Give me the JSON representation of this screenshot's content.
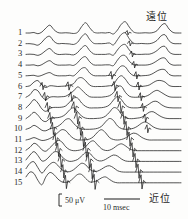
{
  "figure": {
    "background_color": "#fdfdfc",
    "trace_color": "#1a1a1a"
  },
  "channels": {
    "labels": [
      "1",
      "2",
      "3",
      "4",
      "5",
      "6",
      "7",
      "8",
      "9",
      "10",
      "11",
      "12",
      "13",
      "14",
      "15"
    ],
    "count": 15
  },
  "annotations": {
    "distal": "遠位",
    "proximal": "近位"
  },
  "scale_bars": {
    "amplitude_label": "50 μV",
    "time_label": "10 msec"
  },
  "chart_data": {
    "type": "line",
    "xlabel": "",
    "ylabel": "",
    "x_scale_bar": {
      "label": "10 msec",
      "pixels": 36
    },
    "y_scale_bar": {
      "label": "50 μV",
      "pixels": 12
    },
    "grid": false,
    "legend": null,
    "annotations": [
      {
        "text": "遠位",
        "position": "top-right",
        "meaning": "distal"
      },
      {
        "text": "近位",
        "position": "bottom-right",
        "meaning": "proximal"
      }
    ],
    "channel_labels": [
      "1",
      "2",
      "3",
      "4",
      "5",
      "6",
      "7",
      "8",
      "9",
      "10",
      "11",
      "12",
      "13",
      "14",
      "15"
    ],
    "x_domain": [
      0,
      100
    ],
    "series": [
      {
        "name": "1",
        "baseline_y": 33,
        "values": [
          0,
          0,
          0.2,
          -0.3,
          0.4,
          2.0,
          3.2,
          1.4,
          0.2,
          0,
          0.1,
          0,
          -0.2,
          0.3,
          2.6,
          4.2,
          2.2,
          0.4,
          0,
          0.1,
          0,
          0.2,
          -0.4,
          1.2,
          3.6,
          4.6,
          2.4,
          0.5,
          0,
          0,
          0.1,
          0,
          0.2,
          1.0,
          3.0,
          3.8,
          1.6,
          0.2,
          0,
          0
        ]
      },
      {
        "name": "2",
        "baseline_y": 43.7,
        "values": [
          0,
          0,
          -0.2,
          -0.6,
          0.6,
          2.4,
          3.0,
          1.0,
          0,
          0.1,
          0,
          -0.1,
          -0.3,
          0.6,
          2.8,
          4.0,
          1.8,
          0.2,
          0,
          0,
          0.1,
          0.3,
          -0.5,
          1.6,
          3.8,
          4.4,
          2.0,
          0.3,
          0,
          0.1,
          0,
          0,
          0.4,
          1.4,
          3.2,
          3.6,
          1.2,
          0.1,
          0,
          0
        ]
      },
      {
        "name": "3",
        "baseline_y": 54.4,
        "values": [
          0,
          0.1,
          0,
          -0.4,
          0.3,
          1.6,
          2.4,
          0.8,
          0,
          0,
          0.1,
          0,
          -0.2,
          0.8,
          2.6,
          3.6,
          1.6,
          0.2,
          0,
          0,
          0,
          0.2,
          -0.3,
          1.8,
          3.6,
          4.0,
          1.8,
          0.2,
          0,
          0,
          0.1,
          0.1,
          0.6,
          1.6,
          3.0,
          3.2,
          1.0,
          0.1,
          0,
          0
        ]
      },
      {
        "name": "4",
        "baseline_y": 65.1,
        "values": [
          0,
          0,
          0.1,
          -0.3,
          0.2,
          1.2,
          1.8,
          0.6,
          0,
          0,
          0,
          0.1,
          -0.1,
          1.0,
          2.8,
          3.4,
          1.4,
          0.1,
          0,
          0,
          0.1,
          0.1,
          -0.2,
          2.0,
          3.8,
          3.8,
          1.6,
          0.2,
          0,
          0,
          0,
          0.2,
          0.8,
          1.8,
          2.8,
          2.8,
          0.8,
          0,
          0,
          0
        ]
      },
      {
        "name": "5",
        "baseline_y": 75.8,
        "values": [
          0,
          0.1,
          0.2,
          -0.2,
          0.2,
          0.9,
          1.3,
          0.4,
          0,
          0,
          0,
          0.2,
          0,
          1.4,
          3.0,
          3.2,
          1.2,
          0.1,
          0,
          0,
          0,
          0.2,
          0,
          2.4,
          4.0,
          3.6,
          1.4,
          0.1,
          0,
          0,
          0.1,
          0.3,
          1.0,
          2.0,
          2.6,
          2.4,
          0.6,
          0,
          0,
          0
        ]
      },
      {
        "name": "6",
        "baseline_y": 86.5,
        "values": [
          0,
          0.3,
          1.8,
          2.4,
          0.6,
          -0.4,
          0.3,
          0.2,
          0,
          0.1,
          0.2,
          0.6,
          1.2,
          3.2,
          3.6,
          2.4,
          0.6,
          0,
          0,
          0,
          0.1,
          0.3,
          0.8,
          3.2,
          4.4,
          3.0,
          0.8,
          0,
          0,
          0,
          0.2,
          0.6,
          1.6,
          2.4,
          2.4,
          1.8,
          0.4,
          0,
          0,
          0
        ]
      },
      {
        "name": "7",
        "baseline_y": 97.2,
        "values": [
          0,
          1.0,
          3.0,
          2.6,
          0.2,
          -1.0,
          0,
          0.2,
          0.1,
          0.2,
          0.4,
          1.4,
          2.6,
          4.2,
          3.0,
          1.4,
          0.2,
          0,
          0,
          0,
          0.2,
          0.6,
          1.8,
          4.2,
          4.4,
          2.0,
          0.4,
          0,
          0,
          0.1,
          0.3,
          1.0,
          2.2,
          2.8,
          2.0,
          1.0,
          0.2,
          0,
          0,
          0
        ]
      },
      {
        "name": "8",
        "baseline_y": 107.9,
        "values": [
          0,
          1.6,
          3.4,
          2.0,
          -0.4,
          -1.4,
          -0.2,
          0.2,
          0.2,
          0.3,
          0.8,
          2.4,
          4.0,
          4.0,
          2.0,
          0.6,
          0,
          0,
          0,
          0.1,
          0.4,
          1.2,
          3.2,
          4.6,
          3.4,
          1.2,
          0.2,
          0,
          0,
          0.2,
          0.6,
          1.6,
          2.6,
          2.6,
          1.4,
          0.5,
          0.1,
          0,
          0,
          0
        ]
      },
      {
        "name": "9",
        "baseline_y": 118.6,
        "values": [
          0,
          1.2,
          2.6,
          1.4,
          -0.6,
          -1.2,
          0,
          0.3,
          0.4,
          0.8,
          1.8,
          3.6,
          4.4,
          2.8,
          1.0,
          0.2,
          0,
          0,
          0.1,
          0.3,
          1.0,
          2.6,
          4.4,
          4.0,
          1.8,
          0.4,
          0,
          0,
          0.2,
          0.5,
          1.4,
          2.6,
          2.8,
          1.8,
          0.8,
          0.2,
          0,
          0,
          0,
          0
        ]
      },
      {
        "name": "10",
        "baseline_y": 129.3,
        "values": [
          0,
          0.6,
          1.6,
          0.8,
          -0.4,
          -0.6,
          0.2,
          0.6,
          1.2,
          2.4,
          4.0,
          4.2,
          2.4,
          0.8,
          0.1,
          0,
          0,
          0.1,
          0.4,
          1.2,
          3.0,
          4.4,
          3.6,
          1.4,
          0.3,
          0,
          0.1,
          0.4,
          1.2,
          2.4,
          3.0,
          2.2,
          1.0,
          0.3,
          0,
          0,
          0,
          0,
          0,
          0
        ]
      },
      {
        "name": "11",
        "baseline_y": 140,
        "values": [
          0,
          0.4,
          1.0,
          0.4,
          -0.2,
          0,
          0.6,
          1.6,
          3.0,
          4.2,
          3.8,
          2.0,
          0.6,
          0,
          0,
          0.1,
          0.4,
          1.4,
          3.2,
          4.2,
          3.0,
          1.0,
          0.2,
          0,
          0.2,
          0.8,
          2.0,
          2.8,
          2.4,
          1.2,
          0.4,
          0,
          0,
          0,
          0,
          0,
          0,
          0,
          0,
          0
        ]
      },
      {
        "name": "12",
        "baseline_y": 150.7,
        "values": [
          0.2,
          1.4,
          3.0,
          2.2,
          0.4,
          -0.2,
          1.2,
          2.8,
          4.2,
          3.6,
          1.6,
          0.4,
          0,
          0.1,
          0.5,
          1.6,
          3.4,
          4.0,
          2.4,
          0.8,
          0.1,
          0.2,
          1.0,
          2.2,
          2.8,
          2.0,
          0.8,
          0.2,
          0,
          0,
          0,
          0,
          0,
          0,
          0,
          0,
          0,
          0,
          0,
          0
        ]
      },
      {
        "name": "13",
        "baseline_y": 161.4,
        "values": [
          0.6,
          2.6,
          4.0,
          2.4,
          0.2,
          0.6,
          2.2,
          3.8,
          3.8,
          2.0,
          0.6,
          0,
          0.2,
          0.8,
          2.2,
          3.6,
          3.4,
          1.6,
          0.4,
          0.2,
          0.8,
          1.8,
          2.6,
          2.2,
          1.0,
          0.2,
          0,
          0,
          0,
          0,
          0,
          0,
          0,
          0,
          0,
          0,
          0,
          0,
          0,
          0
        ]
      },
      {
        "name": "14",
        "baseline_y": 172.1,
        "values": [
          1.4,
          3.6,
          4.2,
          1.8,
          -0.4,
          1.4,
          3.2,
          4.0,
          2.8,
          1.0,
          0.2,
          0.2,
          1.0,
          2.4,
          3.6,
          3.0,
          1.2,
          0.3,
          0.4,
          1.2,
          2.2,
          2.6,
          1.8,
          0.6,
          0.1,
          0,
          0,
          0,
          0,
          0,
          0,
          0,
          0,
          0,
          0,
          0,
          0,
          0,
          0,
          0
        ]
      },
      {
        "name": "15",
        "baseline_y": 182.8,
        "values": [
          2.4,
          4.4,
          3.8,
          1.0,
          -0.8,
          2.4,
          4.2,
          3.4,
          1.6,
          0.4,
          0.2,
          0.6,
          2.0,
          3.4,
          3.4,
          1.8,
          0.4,
          0.4,
          1.0,
          2.0,
          2.4,
          1.4,
          0.4,
          0,
          0,
          0,
          0,
          0,
          0,
          0,
          0,
          0,
          0,
          0,
          0,
          0,
          0,
          0,
          0,
          0
        ]
      }
    ]
  }
}
